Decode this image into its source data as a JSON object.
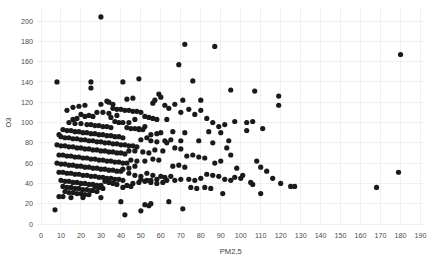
{
  "chart_data": {
    "type": "scatter",
    "title": "",
    "xlabel": "PM2,5",
    "ylabel": "O3",
    "xlim": [
      0,
      193
    ],
    "ylim": [
      -3,
      210
    ],
    "grid": true,
    "legend": false,
    "marker": {
      "color": "#1a1a1a",
      "shape": "circle",
      "size_px": 3.4
    },
    "xticks": [
      0,
      10,
      20,
      30,
      40,
      50,
      60,
      70,
      80,
      90,
      100,
      110,
      120,
      130,
      140,
      150,
      160,
      170,
      180,
      190
    ],
    "yticks": [
      0,
      20,
      40,
      60,
      80,
      100,
      120,
      140,
      160,
      180,
      200
    ],
    "xtick_labels": [
      "0",
      "10",
      "20",
      "30",
      "40",
      "50",
      "60",
      "70",
      "80",
      "90",
      "100",
      "110",
      "120",
      "130",
      "140",
      "150",
      "160",
      "170",
      "180",
      "190"
    ],
    "ytick_labels": [
      "0",
      "20",
      "40",
      "60",
      "80",
      "100",
      "120",
      "140",
      "160",
      "180",
      "200"
    ],
    "n_points": 332,
    "points": [
      [
        30,
        204
      ],
      [
        72,
        177
      ],
      [
        87,
        175
      ],
      [
        180,
        167
      ],
      [
        69,
        157
      ],
      [
        41,
        140
      ],
      [
        8,
        140
      ],
      [
        49,
        143
      ],
      [
        25,
        140
      ],
      [
        76,
        141
      ],
      [
        25,
        134
      ],
      [
        95,
        132
      ],
      [
        107,
        131
      ],
      [
        59,
        128
      ],
      [
        119,
        126
      ],
      [
        46,
        124
      ],
      [
        43,
        123
      ],
      [
        71,
        122
      ],
      [
        80,
        122
      ],
      [
        33,
        121
      ],
      [
        34,
        120
      ],
      [
        119,
        117
      ],
      [
        56,
        119
      ],
      [
        30,
        118
      ],
      [
        36,
        118
      ],
      [
        62,
        117
      ],
      [
        22,
        117
      ],
      [
        19,
        116
      ],
      [
        16,
        115
      ],
      [
        36,
        114
      ],
      [
        38,
        113
      ],
      [
        40,
        113
      ],
      [
        42,
        112
      ],
      [
        44,
        112
      ],
      [
        13,
        112
      ],
      [
        46,
        111
      ],
      [
        48,
        111
      ],
      [
        50,
        110
      ],
      [
        28,
        110
      ],
      [
        31,
        110
      ],
      [
        34,
        109
      ],
      [
        20,
        108
      ],
      [
        24,
        107
      ],
      [
        22,
        106
      ],
      [
        26,
        106
      ],
      [
        52,
        106
      ],
      [
        54,
        105
      ],
      [
        56,
        104
      ],
      [
        18,
        104
      ],
      [
        16,
        103
      ],
      [
        58,
        103
      ],
      [
        63,
        103
      ],
      [
        97,
        101
      ],
      [
        106,
        101
      ],
      [
        37,
        101
      ],
      [
        39,
        100
      ],
      [
        41,
        100
      ],
      [
        14,
        100
      ],
      [
        17,
        99
      ],
      [
        20,
        99
      ],
      [
        23,
        98
      ],
      [
        25,
        98
      ],
      [
        27,
        97
      ],
      [
        29,
        97
      ],
      [
        31,
        96
      ],
      [
        33,
        96
      ],
      [
        35,
        95
      ],
      [
        43,
        95
      ],
      [
        45,
        94
      ],
      [
        47,
        94
      ],
      [
        49,
        93
      ],
      [
        51,
        93
      ],
      [
        11,
        93
      ],
      [
        13,
        92
      ],
      [
        15,
        92
      ],
      [
        17,
        91
      ],
      [
        19,
        91
      ],
      [
        21,
        90
      ],
      [
        23,
        90
      ],
      [
        25,
        89
      ],
      [
        27,
        89
      ],
      [
        29,
        88
      ],
      [
        31,
        88
      ],
      [
        33,
        87
      ],
      [
        35,
        87
      ],
      [
        37,
        86
      ],
      [
        39,
        86
      ],
      [
        41,
        85
      ],
      [
        53,
        85
      ],
      [
        60,
        90
      ],
      [
        66,
        91
      ],
      [
        72,
        90
      ],
      [
        84,
        91
      ],
      [
        90,
        90
      ],
      [
        103,
        92
      ],
      [
        9,
        88
      ],
      [
        10,
        86
      ],
      [
        12,
        85
      ],
      [
        14,
        85
      ],
      [
        16,
        84
      ],
      [
        18,
        84
      ],
      [
        20,
        83
      ],
      [
        22,
        83
      ],
      [
        24,
        82
      ],
      [
        26,
        82
      ],
      [
        28,
        81
      ],
      [
        30,
        81
      ],
      [
        32,
        80
      ],
      [
        34,
        80
      ],
      [
        36,
        79
      ],
      [
        38,
        79
      ],
      [
        40,
        78
      ],
      [
        42,
        78
      ],
      [
        44,
        77
      ],
      [
        46,
        77
      ],
      [
        48,
        76
      ],
      [
        50,
        83
      ],
      [
        55,
        82
      ],
      [
        58,
        81
      ],
      [
        63,
        80
      ],
      [
        70,
        82
      ],
      [
        79,
        82
      ],
      [
        86,
        80
      ],
      [
        94,
        82
      ],
      [
        8,
        78
      ],
      [
        10,
        77
      ],
      [
        12,
        77
      ],
      [
        14,
        76
      ],
      [
        16,
        76
      ],
      [
        18,
        75
      ],
      [
        20,
        75
      ],
      [
        22,
        74
      ],
      [
        24,
        74
      ],
      [
        26,
        73
      ],
      [
        28,
        73
      ],
      [
        30,
        72
      ],
      [
        32,
        72
      ],
      [
        34,
        71
      ],
      [
        36,
        71
      ],
      [
        38,
        70
      ],
      [
        40,
        70
      ],
      [
        42,
        69
      ],
      [
        44,
        72
      ],
      [
        47,
        72
      ],
      [
        51,
        71
      ],
      [
        54,
        70
      ],
      [
        57,
        73
      ],
      [
        61,
        72
      ],
      [
        9,
        68
      ],
      [
        11,
        68
      ],
      [
        13,
        67
      ],
      [
        15,
        67
      ],
      [
        17,
        66
      ],
      [
        19,
        66
      ],
      [
        21,
        65
      ],
      [
        23,
        65
      ],
      [
        25,
        64
      ],
      [
        27,
        64
      ],
      [
        29,
        63
      ],
      [
        31,
        63
      ],
      [
        33,
        62
      ],
      [
        35,
        62
      ],
      [
        37,
        61
      ],
      [
        39,
        61
      ],
      [
        41,
        60
      ],
      [
        43,
        60
      ],
      [
        45,
        63
      ],
      [
        48,
        62
      ],
      [
        52,
        62
      ],
      [
        56,
        64
      ],
      [
        59,
        63
      ],
      [
        8,
        60
      ],
      [
        10,
        59
      ],
      [
        12,
        59
      ],
      [
        14,
        58
      ],
      [
        16,
        58
      ],
      [
        18,
        57
      ],
      [
        20,
        57
      ],
      [
        22,
        56
      ],
      [
        24,
        56
      ],
      [
        26,
        55
      ],
      [
        28,
        55
      ],
      [
        30,
        54
      ],
      [
        32,
        54
      ],
      [
        34,
        53
      ],
      [
        36,
        53
      ],
      [
        38,
        52
      ],
      [
        40,
        52
      ],
      [
        9,
        51
      ],
      [
        11,
        51
      ],
      [
        13,
        50
      ],
      [
        15,
        50
      ],
      [
        17,
        49
      ],
      [
        19,
        49
      ],
      [
        21,
        48
      ],
      [
        23,
        48
      ],
      [
        25,
        47
      ],
      [
        27,
        47
      ],
      [
        29,
        46
      ],
      [
        31,
        46
      ],
      [
        33,
        45
      ],
      [
        35,
        45
      ],
      [
        37,
        44
      ],
      [
        39,
        44
      ],
      [
        41,
        43
      ],
      [
        10,
        43
      ],
      [
        12,
        42
      ],
      [
        14,
        42
      ],
      [
        16,
        41
      ],
      [
        18,
        41
      ],
      [
        20,
        40
      ],
      [
        22,
        40
      ],
      [
        24,
        39
      ],
      [
        26,
        39
      ],
      [
        28,
        38
      ],
      [
        30,
        38
      ],
      [
        32,
        42
      ],
      [
        34,
        41
      ],
      [
        36,
        40
      ],
      [
        38,
        39
      ],
      [
        11,
        37
      ],
      [
        13,
        36
      ],
      [
        15,
        36
      ],
      [
        17,
        35
      ],
      [
        19,
        35
      ],
      [
        21,
        34
      ],
      [
        23,
        34
      ],
      [
        25,
        33
      ],
      [
        27,
        37
      ],
      [
        29,
        36
      ],
      [
        31,
        35
      ],
      [
        12,
        32
      ],
      [
        14,
        31
      ],
      [
        16,
        31
      ],
      [
        18,
        30
      ],
      [
        20,
        30
      ],
      [
        22,
        29
      ],
      [
        24,
        29
      ],
      [
        26,
        33
      ],
      [
        28,
        32
      ],
      [
        9,
        27
      ],
      [
        11,
        27
      ],
      [
        15,
        26
      ],
      [
        21,
        26
      ],
      [
        30,
        26
      ],
      [
        7,
        14
      ],
      [
        44,
        50
      ],
      [
        47,
        48
      ],
      [
        50,
        47
      ],
      [
        53,
        50
      ],
      [
        56,
        48
      ],
      [
        60,
        47
      ],
      [
        50,
        44
      ],
      [
        53,
        43
      ],
      [
        55,
        43
      ],
      [
        58,
        44
      ],
      [
        62,
        46
      ],
      [
        65,
        47
      ],
      [
        46,
        40
      ],
      [
        49,
        41
      ],
      [
        52,
        42
      ],
      [
        55,
        41
      ],
      [
        58,
        40
      ],
      [
        61,
        41
      ],
      [
        43,
        38
      ],
      [
        45,
        37
      ],
      [
        41,
        36
      ],
      [
        40,
        22
      ],
      [
        42,
        9
      ],
      [
        52,
        19
      ],
      [
        54,
        18
      ],
      [
        55,
        20
      ],
      [
        50,
        13
      ],
      [
        44,
        55
      ],
      [
        47,
        57
      ],
      [
        41,
        54
      ],
      [
        66,
        57
      ],
      [
        69,
        58
      ],
      [
        72,
        56
      ],
      [
        63,
        43
      ],
      [
        67,
        43
      ],
      [
        70,
        44
      ],
      [
        64,
        22
      ],
      [
        71,
        15
      ],
      [
        74,
        44
      ],
      [
        77,
        43
      ],
      [
        80,
        45
      ],
      [
        75,
        36
      ],
      [
        78,
        35
      ],
      [
        83,
        49
      ],
      [
        86,
        48
      ],
      [
        89,
        47
      ],
      [
        82,
        36
      ],
      [
        85,
        35
      ],
      [
        92,
        44
      ],
      [
        95,
        43
      ],
      [
        91,
        30
      ],
      [
        97,
        46
      ],
      [
        100,
        45
      ],
      [
        105,
        41
      ],
      [
        106,
        39
      ],
      [
        110,
        30
      ],
      [
        110,
        56
      ],
      [
        120,
        40
      ],
      [
        125,
        37
      ],
      [
        127,
        37
      ],
      [
        87,
        60
      ],
      [
        90,
        62
      ],
      [
        93,
        75
      ],
      [
        95,
        68
      ],
      [
        98,
        55
      ],
      [
        101,
        48
      ],
      [
        79,
        66
      ],
      [
        82,
        65
      ],
      [
        73,
        67
      ],
      [
        76,
        68
      ],
      [
        67,
        75
      ],
      [
        70,
        74
      ],
      [
        62,
        82
      ],
      [
        65,
        83
      ],
      [
        55,
        88
      ],
      [
        58,
        89
      ],
      [
        49,
        94
      ],
      [
        52,
        96
      ],
      [
        44,
        100
      ],
      [
        47,
        103
      ],
      [
        35,
        105
      ],
      [
        38,
        107
      ],
      [
        108,
        62
      ],
      [
        116,
        45
      ],
      [
        113,
        52
      ],
      [
        168,
        36
      ],
      [
        179,
        51
      ],
      [
        103,
        100
      ],
      [
        111,
        94
      ],
      [
        89,
        96
      ],
      [
        92,
        98
      ],
      [
        83,
        104
      ],
      [
        86,
        100
      ],
      [
        77,
        108
      ],
      [
        80,
        112
      ],
      [
        70,
        110
      ],
      [
        74,
        113
      ],
      [
        64,
        114
      ],
      [
        67,
        118
      ],
      [
        57,
        122
      ],
      [
        60,
        125
      ]
    ]
  },
  "axes": {
    "x_axis_name": "PM2,5",
    "y_axis_name": "O3"
  }
}
